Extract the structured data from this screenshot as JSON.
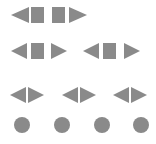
{
  "colors": {
    "shape": "#8a8a8a",
    "background": "#ffffff"
  },
  "rows": [
    {
      "name": "row-1",
      "pattern": [
        "arrow-left",
        "square",
        "square",
        "arrow-right"
      ]
    },
    {
      "name": "row-2",
      "groups": [
        [
          "arrow-left",
          "square",
          "arrow-right"
        ],
        [
          "arrow-left",
          "square",
          "arrow-right"
        ]
      ]
    },
    {
      "name": "row-3",
      "groups": [
        [
          "arrow-left",
          "arrow-right"
        ],
        [
          "arrow-left",
          "arrow-right"
        ],
        [
          "arrow-left",
          "arrow-right"
        ]
      ]
    },
    {
      "name": "row-4",
      "items": [
        "circle",
        "circle",
        "circle",
        "circle"
      ]
    }
  ]
}
